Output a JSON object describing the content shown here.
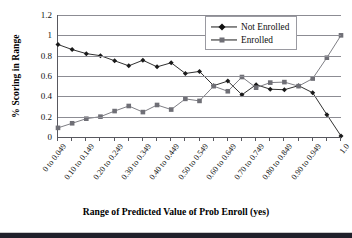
{
  "chart_data": {
    "type": "line",
    "title": "",
    "xlabel": "Range of Predicted Value of Prob Enroll (yes)",
    "ylabel": "% Scoring in Range",
    "ylim": [
      0,
      1.2
    ],
    "ytick_labels": [
      "0",
      "0.2",
      "0.4",
      "0.6",
      "0.8",
      "1",
      "1.2"
    ],
    "ytick_values": [
      0,
      0.2,
      0.4,
      0.6,
      0.8,
      1,
      1.2
    ],
    "grid": "horizontal",
    "legend_position": "top-right",
    "categories": [
      "0 to 0.049",
      "0.05 to 0.099",
      "0.10 to 0.149",
      "0.15 to 0.199",
      "0.20 to 0.249",
      "0.25 to 0.299",
      "0.30 to 0.349",
      "0.35 to 0.399",
      "0.40 to 0.449",
      "0.45 to 0.499",
      "0.50 to 0.549",
      "0.55 to 0.599",
      "0.60 to 0.649",
      "0.65 to 0.699",
      "0.70 to 0.749",
      "0.75 to 0.799",
      "0.80 to 0.849",
      "0.85 to 0.899",
      "0.90 to 0.949",
      "0.95 to 0.999",
      "1.0"
    ],
    "xtick_labels_shown": [
      "0 to 0.049",
      "0.10 to 0.149",
      "0.20 to 0.249",
      "0.30 to 0.349",
      "0.40 to 0.449",
      "0.50 to 0.549",
      "0.60 to 0.649",
      "0.70 to 0.749",
      "0.80 to 0.849",
      "0.90 to 0.949",
      "1.0"
    ],
    "series": [
      {
        "name": "Not Enrolled",
        "marker": "diamond",
        "color": "#1a1a1a",
        "values": [
          0.91,
          0.86,
          0.82,
          0.8,
          0.75,
          0.7,
          0.755,
          0.69,
          0.73,
          0.625,
          0.645,
          0.505,
          0.55,
          0.415,
          0.515,
          0.47,
          0.465,
          0.505,
          0.435,
          0.22,
          0.01
        ]
      },
      {
        "name": "Enrolled",
        "marker": "square",
        "color": "#6f6f76",
        "values": [
          0.09,
          0.135,
          0.18,
          0.2,
          0.255,
          0.305,
          0.245,
          0.315,
          0.27,
          0.375,
          0.355,
          0.5,
          0.45,
          0.59,
          0.485,
          0.535,
          0.54,
          0.5,
          0.575,
          0.78,
          1.0
        ]
      }
    ]
  }
}
